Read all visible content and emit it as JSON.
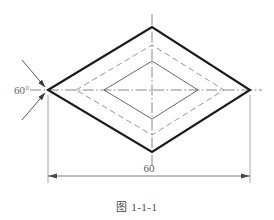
{
  "figure": {
    "caption": "图 1-1-1",
    "title_note": "",
    "type": "engineering-orthographic-drawing"
  },
  "annotations": {
    "angle_label": "60°",
    "length_label": "60"
  },
  "geometry": {
    "outer_diamond": {
      "left": {
        "x": 48,
        "y": 90
      },
      "right": {
        "x": 250,
        "y": 90
      },
      "top": {
        "x": 152,
        "y": 27
      },
      "bottom": {
        "x": 152,
        "y": 152
      },
      "stroke_width": 2.0,
      "style": "solid"
    },
    "middle_diamond": {
      "left": {
        "x": 76,
        "y": 90
      },
      "right": {
        "x": 224,
        "y": 90
      },
      "top": {
        "x": 152,
        "y": 45
      },
      "bottom": {
        "x": 152,
        "y": 135
      },
      "stroke_width": 0.9,
      "style": "dashed"
    },
    "inner_diamond": {
      "left": {
        "x": 104,
        "y": 90
      },
      "right": {
        "x": 198,
        "y": 90
      },
      "top": {
        "x": 152,
        "y": 61
      },
      "bottom": {
        "x": 152,
        "y": 119
      },
      "stroke_width": 0.8,
      "style": "solid"
    },
    "horizontal_centre_line": {
      "x1": 30,
      "y1": 90,
      "x2": 262,
      "y2": 90
    },
    "vertical_centre_line": {
      "x1": 152,
      "y1": 14,
      "x2": 152,
      "y2": 166
    },
    "dimension_line": {
      "x1": 48,
      "y1": 176,
      "x2": 250,
      "y2": 176
    },
    "extension_left": {
      "x1": 48,
      "y1": 94,
      "x2": 48,
      "y2": 182
    },
    "extension_right": {
      "x1": 250,
      "y1": 94,
      "x2": 250,
      "y2": 182
    },
    "angle_leader_upper": {
      "x1": 48,
      "y1": 90,
      "x2": 24,
      "y2": 62
    },
    "angle_leader_lower": {
      "x1": 48,
      "y1": 90,
      "x2": 24,
      "y2": 118
    }
  },
  "colors": {
    "outline": "#1a1a1a",
    "hidden_line": "#8a8a8a",
    "thin_line": "#4d4d4d",
    "centre_line": "#6a6a6a",
    "dimension": "#5a5a5a",
    "text": "#555555",
    "background": "#ffffff"
  }
}
